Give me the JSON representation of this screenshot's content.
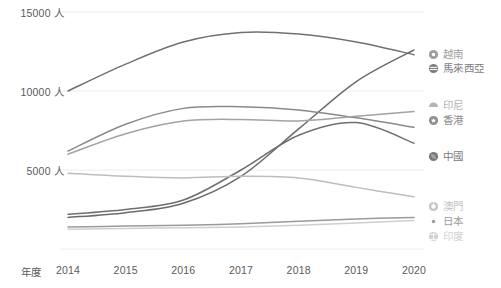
{
  "chart_data": {
    "type": "line",
    "title": "",
    "xlabel": "年度",
    "ylabel": "",
    "x": [
      2014,
      2015,
      2016,
      2017,
      2018,
      2019,
      2020
    ],
    "categories": [
      "2014",
      "2015",
      "2016",
      "2017",
      "2018",
      "2019",
      "2020"
    ],
    "ylim": [
      0,
      15000
    ],
    "yticks": [
      5000,
      10000,
      15000
    ],
    "ytick_labels": [
      "5000 人",
      "10000 人",
      "15000 人"
    ],
    "unit_suffix": "人",
    "grid": true,
    "grid_axis": "y",
    "legend_position": "right",
    "series": [
      {
        "name": "越南",
        "color": "#707070",
        "marker": "circle-dot",
        "values": [
          10000,
          11700,
          13100,
          13700,
          13600,
          13100,
          12300
        ]
      },
      {
        "name": "馬來西亞",
        "color": "#6b6b6b",
        "marker": "circle-bars",
        "values": [
          2000,
          2300,
          2900,
          4600,
          7600,
          10600,
          12600
        ]
      },
      {
        "name": "印尼",
        "color": "#8a8a8a",
        "marker": "semicircle",
        "values": [
          6200,
          7900,
          8900,
          9000,
          8800,
          8300,
          7700
        ]
      },
      {
        "name": "香港",
        "color": "#a3a3a3",
        "marker": "circle-star",
        "values": [
          6000,
          7300,
          8100,
          8200,
          8100,
          8400,
          8700
        ]
      },
      {
        "name": "中國",
        "color": "#6f6f6f",
        "marker": "circle-solid",
        "values": [
          2200,
          2500,
          3100,
          5000,
          7200,
          8000,
          6700
        ]
      },
      {
        "name": "澳門",
        "color": "#bdbdbd",
        "marker": "circle-ring",
        "values": [
          4800,
          4600,
          4500,
          4600,
          4500,
          3900,
          3300
        ]
      },
      {
        "name": "日本",
        "color": "#9a9a9a",
        "marker": "dot",
        "values": [
          1400,
          1450,
          1500,
          1600,
          1750,
          1900,
          2000
        ]
      },
      {
        "name": "印度",
        "color": "#cfcfcf",
        "marker": "circle-anchor",
        "values": [
          1250,
          1300,
          1350,
          1400,
          1500,
          1650,
          1800
        ]
      }
    ]
  },
  "axis": {
    "x_title": "年度"
  },
  "legend": {
    "items": [
      {
        "label": "越南",
        "icon": "circle-dot-icon",
        "color": "#9e9e9e"
      },
      {
        "label": "馬來西亞",
        "icon": "circle-bars-icon",
        "color": "#7d7d7d"
      },
      {
        "label": "印尼",
        "icon": "semicircle-icon",
        "color": "#b5b5b5"
      },
      {
        "label": "香港",
        "icon": "circle-star-icon",
        "color": "#8f8f8f"
      },
      {
        "label": "中國",
        "icon": "circle-solid-icon",
        "color": "#7a7a7a"
      },
      {
        "label": "澳門",
        "icon": "circle-ring-icon",
        "color": "#c4c4c4"
      },
      {
        "label": "日本",
        "icon": "dot-icon",
        "color": "#9c9c9c"
      },
      {
        "label": "印度",
        "icon": "circle-anchor-icon",
        "color": "#d2d2d2"
      }
    ]
  }
}
